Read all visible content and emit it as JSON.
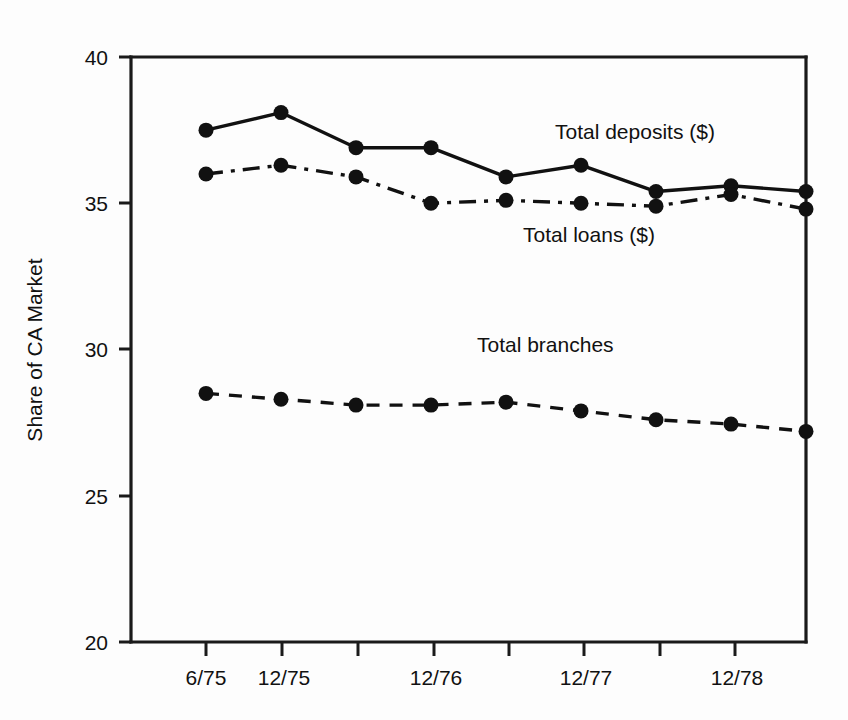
{
  "chart_data": {
    "type": "line",
    "title": "",
    "xlabel": "",
    "ylabel": "Share of CA Market",
    "ylim": [
      20,
      40
    ],
    "yticks": [
      20,
      25,
      30,
      35,
      40
    ],
    "ytick_labels": [
      "20",
      "25",
      "30",
      "35",
      "40"
    ],
    "grid": false,
    "legend_position": "inline-annotations",
    "x": [
      "6/75",
      "12/75",
      "6/76",
      "12/76",
      "6/77",
      "12/77",
      "6/78",
      "12/78",
      "6/79"
    ],
    "xtick_labels": [
      "6/75",
      "12/75",
      "",
      "12/76",
      "",
      "12/77",
      "",
      "12/78"
    ],
    "xtick_count": 8,
    "series": [
      {
        "name": "Total deposits ($)",
        "style": "solid",
        "marker": "filled-circle",
        "values": [
          37.5,
          38.1,
          36.9,
          36.9,
          35.9,
          36.3,
          35.4,
          35.6,
          35.4
        ]
      },
      {
        "name": "Total loans ($)",
        "style": "dash-dot",
        "marker": "filled-circle",
        "values": [
          36.0,
          36.3,
          35.9,
          35.0,
          35.1,
          35.0,
          34.9,
          35.3,
          34.8
        ]
      },
      {
        "name": "Total branches",
        "style": "dashed",
        "marker": "filled-circle",
        "values": [
          28.5,
          28.3,
          28.1,
          28.1,
          28.2,
          27.9,
          27.6,
          27.45,
          27.2
        ]
      }
    ],
    "annotations": [
      {
        "text": "Total deposits ($)",
        "x_px": 555,
        "y_px": 139
      },
      {
        "text": "Total loans ($)",
        "x_px": 523,
        "y_px": 242
      },
      {
        "text": "Total branches",
        "x_px": 477,
        "y_px": 352
      }
    ]
  },
  "axes": {
    "y_axis_title": "Share of CA Market",
    "y_tick_0": "20",
    "y_tick_1": "25",
    "y_tick_2": "30",
    "y_tick_3": "35",
    "y_tick_4": "40",
    "x_tick_0": "6/75",
    "x_tick_1": "12/75",
    "x_tick_3": "12/76",
    "x_tick_5": "12/77",
    "x_tick_7": "12/78"
  }
}
